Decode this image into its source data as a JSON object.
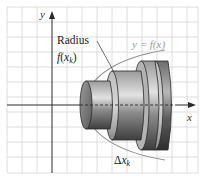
{
  "figure": {
    "axes": {
      "x_label": "x",
      "y_label": "y"
    },
    "labels": {
      "radius_word": "Radius",
      "radius_expr_f": "f",
      "radius_expr_open": "(",
      "radius_expr_x": "x",
      "radius_expr_sub": "k",
      "radius_expr_close": ")",
      "curve_label": "y = f(x)",
      "delta_symbol": "Δ",
      "delta_x": "x",
      "delta_sub": "k"
    },
    "colors": {
      "grid": "#d4d4d4",
      "axis": "#2a2a2a",
      "curve": "#8c8c8c",
      "curve_label": "#9a9a9a",
      "disk_dark": "#4a4a4a",
      "disk_mid": "#8a8a8a",
      "disk_light": "#c8c8c8"
    },
    "disks": [
      {
        "name": "disk-1",
        "x_start": 85,
        "x_end": 110,
        "radius": 24
      },
      {
        "name": "disk-2",
        "x_start": 110,
        "x_end": 140,
        "radius": 34
      },
      {
        "name": "disk-3",
        "x_start": 140,
        "x_end": 155,
        "radius": 44
      },
      {
        "name": "disk-4",
        "x_start": 155,
        "x_end": 170,
        "radius": 45
      }
    ]
  }
}
